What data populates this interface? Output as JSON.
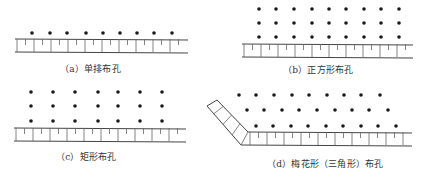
{
  "colors": {
    "ink": "#1a1a1a",
    "line": "#444444",
    "tick": "#666666",
    "caption": "#333333",
    "background": "#ffffff"
  },
  "panels": [
    {
      "id": "a",
      "caption": "（a）单排布孔",
      "caption_pos": [
        60,
        62
      ],
      "wall": {
        "x1": 15,
        "x2": 188,
        "top_y": 39,
        "bottom_y": 52,
        "major_every": 17,
        "minor": true
      },
      "rows": [
        {
          "y": 33,
          "xs": [
            32,
            50,
            67,
            86,
            103,
            120,
            137,
            154,
            172
          ]
        }
      ]
    },
    {
      "id": "b",
      "caption": "（b）正方形布孔",
      "caption_pos": [
        283,
        63
      ],
      "wall": {
        "x1": 242,
        "x2": 413,
        "top_y": 44,
        "bottom_y": 57,
        "major_every": 17,
        "minor": true
      },
      "rows": [
        {
          "y": 9,
          "xs": [
            259,
            276,
            294,
            312,
            329,
            346,
            364,
            381,
            399
          ]
        },
        {
          "y": 23,
          "xs": [
            259,
            276,
            294,
            312,
            329,
            346,
            364,
            381,
            399
          ]
        },
        {
          "y": 37,
          "xs": [
            259,
            276,
            294,
            312,
            329,
            346,
            364,
            381,
            399
          ]
        }
      ]
    },
    {
      "id": "c",
      "caption": "（c）矩形布孔",
      "caption_pos": [
        56,
        150
      ],
      "wall": {
        "x1": 14,
        "x2": 186,
        "top_y": 128,
        "bottom_y": 141,
        "major_every": 17,
        "minor": true
      },
      "rows": [
        {
          "y": 92,
          "xs": [
            31,
            53,
            75,
            98,
            118,
            140,
            162
          ]
        },
        {
          "y": 106,
          "xs": [
            31,
            53,
            75,
            98,
            118,
            140,
            162
          ]
        },
        {
          "y": 121,
          "xs": [
            31,
            53,
            75,
            98,
            118,
            140,
            162
          ]
        }
      ]
    },
    {
      "id": "d",
      "caption": "（d）梅花形（三角形）布孔",
      "caption_pos": [
        267,
        157
      ],
      "wall": {
        "x1": 248,
        "x2": 412,
        "top_y": 132,
        "bottom_y": 145,
        "bottom_x1": 241,
        "major_every": 17,
        "minor": true
      },
      "slope": {
        "outer": [
          [
            207,
            106
          ],
          [
            241,
            145
          ]
        ],
        "inner": [
          [
            217,
            100
          ],
          [
            248,
            132
          ]
        ],
        "top_cap": [
          [
            207,
            106
          ],
          [
            217,
            100
          ]
        ]
      },
      "rows": [
        {
          "y": 95,
          "xs": [
            239,
            256,
            274,
            292,
            309,
            327,
            344,
            361,
            380
          ]
        },
        {
          "y": 110,
          "xs": [
            247,
            264,
            282,
            299,
            317,
            335,
            352,
            369,
            388
          ]
        },
        {
          "y": 126,
          "xs": [
            256,
            273,
            291,
            308,
            326,
            343,
            361,
            378,
            396
          ]
        }
      ]
    }
  ]
}
